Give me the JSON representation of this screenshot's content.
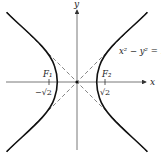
{
  "diagram": {
    "type": "hyperbola",
    "equation_label": "x² − y² = 1",
    "axes": {
      "x_label": "x",
      "y_label": "y"
    },
    "foci": [
      {
        "name": "F₁",
        "tick_label": "−√2",
        "x": -1.4142
      },
      {
        "name": "F₂",
        "tick_label": "√2",
        "x": 1.4142
      }
    ],
    "asymptotes": [
      "y = x",
      "y = −x"
    ],
    "colors": {
      "curve": "#111111",
      "axis": "#555555",
      "asymptote": "#666666"
    }
  }
}
